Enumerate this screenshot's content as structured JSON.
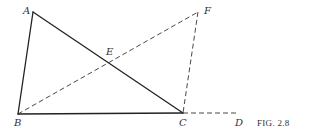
{
  "figure": {
    "caption": "FIG. 2.8",
    "points": {
      "A": {
        "label": "A",
        "x": 33,
        "y": 12
      },
      "B": {
        "label": "B",
        "x": 18,
        "y": 114
      },
      "C": {
        "label": "C",
        "x": 183,
        "y": 113
      },
      "D": {
        "label": "D",
        "x": 238,
        "y": 113
      },
      "E": {
        "label": "E",
        "x": 105,
        "y": 62
      },
      "F": {
        "label": "F",
        "x": 198,
        "y": 12
      }
    },
    "solid_segments": [
      {
        "from": "A",
        "to": "B"
      },
      {
        "from": "B",
        "to": "C"
      },
      {
        "from": "A",
        "to": "C"
      }
    ],
    "dashed_segments": [
      {
        "from": "B",
        "to": "F"
      },
      {
        "from": "F",
        "to": "C"
      },
      {
        "from": "C",
        "to": "D"
      }
    ],
    "colors": {
      "line": "#222222",
      "text": "#333333",
      "background": "#ffffff"
    }
  }
}
